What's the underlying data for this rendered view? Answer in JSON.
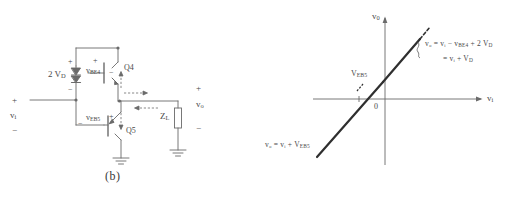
{
  "figure": {
    "caption": "(b)",
    "circuit": {
      "input_label": "v",
      "input_sub": "i",
      "input_plus": "+",
      "input_minus": "−",
      "diode_label_prefix": "2 ",
      "diode_label": "V",
      "diode_sub": "D",
      "diode_plus": "+",
      "diode_minus": "−",
      "q4_label": "Q4",
      "q5_label": "Q5",
      "vbe4_label": "v",
      "vbe4_sub": "BE4",
      "vbe4_plus": "+",
      "vbe4_minus": "−",
      "veb5_label": "v",
      "veb5_sub": "EB5",
      "veb5_plus": "+",
      "veb5_minus": "−",
      "load_label": "Z",
      "load_sub": "L",
      "output_label": "v",
      "output_sub": "o",
      "output_plus": "+",
      "output_minus": "−"
    },
    "graph": {
      "yaxis_label": "v",
      "yaxis_sub": "0",
      "xaxis_label": "v",
      "xaxis_sub": "i",
      "origin_label": "0",
      "offset_label": "V",
      "offset_sub": "EB5",
      "upper_equation_1": "v₀ = vᵢ − v",
      "upper_equation_1_sub": "BE4",
      "upper_equation_1_tail": " + 2 V",
      "upper_equation_1_tail_sub": "D",
      "upper_equation_2": "= vᵢ + V",
      "upper_equation_2_sub": "D",
      "lower_equation": "v₀ = vᵢ + V",
      "lower_equation_sub": "EB5"
    }
  },
  "colors": {
    "ink": "#4a4a4a",
    "line": "#5a5a5a",
    "curve": "#2f2f2f",
    "background": "#ffffff"
  }
}
